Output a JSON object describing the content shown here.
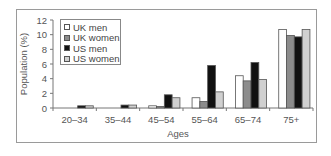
{
  "chart_data": {
    "type": "bar",
    "title": "",
    "xlabel": "Ages",
    "ylabel": "Population (%)",
    "ylim": [
      0,
      12
    ],
    "yticks": [
      0,
      2,
      4,
      6,
      8,
      10,
      12
    ],
    "grid": false,
    "legend_position": "upper-left inside",
    "categories": [
      "20–34",
      "35–44",
      "45–54",
      "55–64",
      "65–74",
      "75+"
    ],
    "series": [
      {
        "name": "UK men",
        "color": "#ffffff",
        "values": [
          0.0,
          0.0,
          0.3,
          1.4,
          4.4,
          10.7
        ]
      },
      {
        "name": "UK women",
        "color": "#8c8c8c",
        "values": [
          0.0,
          0.0,
          0.2,
          0.9,
          3.7,
          9.9
        ]
      },
      {
        "name": "US men",
        "color": "#111111",
        "values": [
          0.3,
          0.4,
          1.8,
          5.8,
          6.2,
          9.7
        ]
      },
      {
        "name": "US women",
        "color": "#d0d0d0",
        "values": [
          0.3,
          0.4,
          1.4,
          2.2,
          3.9,
          10.7
        ]
      }
    ]
  }
}
